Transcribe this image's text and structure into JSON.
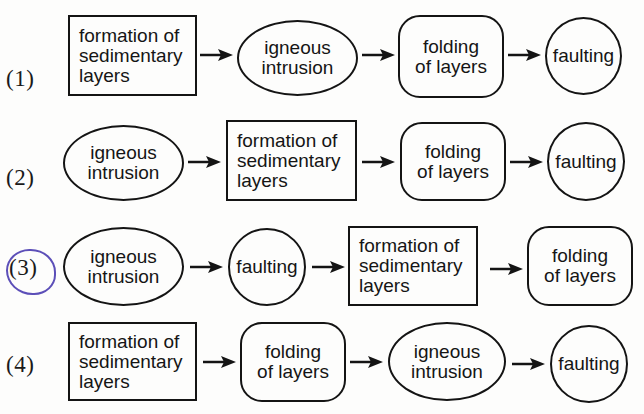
{
  "diagram": {
    "title": "",
    "colors": {
      "stroke": "#141414",
      "highlight": "#5c4fb8",
      "background": "#fdfdfc"
    },
    "options": [
      {
        "label": "(1)",
        "selected": false,
        "steps": [
          {
            "shape": "rectangle",
            "lines": [
              "formation of",
              "sedimentary",
              "layers"
            ]
          },
          {
            "shape": "ellipse",
            "lines": [
              "igneous",
              "intrusion"
            ]
          },
          {
            "shape": "rounded-rectangle",
            "lines": [
              "folding",
              "of layers"
            ]
          },
          {
            "shape": "circle",
            "lines": [
              "faulting"
            ]
          }
        ]
      },
      {
        "label": "(2)",
        "selected": false,
        "steps": [
          {
            "shape": "ellipse",
            "lines": [
              "igneous",
              "intrusion"
            ]
          },
          {
            "shape": "rectangle",
            "lines": [
              "formation of",
              "sedimentary",
              "layers"
            ]
          },
          {
            "shape": "rounded-rectangle",
            "lines": [
              "folding",
              "of layers"
            ]
          },
          {
            "shape": "circle",
            "lines": [
              "faulting"
            ]
          }
        ]
      },
      {
        "label": "(3)",
        "selected": true,
        "steps": [
          {
            "shape": "ellipse",
            "lines": [
              "igneous",
              "intrusion"
            ]
          },
          {
            "shape": "circle",
            "lines": [
              "faulting"
            ]
          },
          {
            "shape": "rectangle",
            "lines": [
              "formation of",
              "sedimentary",
              "layers"
            ]
          },
          {
            "shape": "rounded-rectangle",
            "lines": [
              "folding",
              "of layers"
            ]
          }
        ]
      },
      {
        "label": "(4)",
        "selected": false,
        "steps": [
          {
            "shape": "rectangle",
            "lines": [
              "formation of",
              "sedimentary",
              "layers"
            ]
          },
          {
            "shape": "rounded-rectangle",
            "lines": [
              "folding",
              "of layers"
            ]
          },
          {
            "shape": "ellipse",
            "lines": [
              "igneous",
              "intrusion"
            ]
          },
          {
            "shape": "circle",
            "lines": [
              "faulting"
            ]
          }
        ]
      }
    ]
  }
}
